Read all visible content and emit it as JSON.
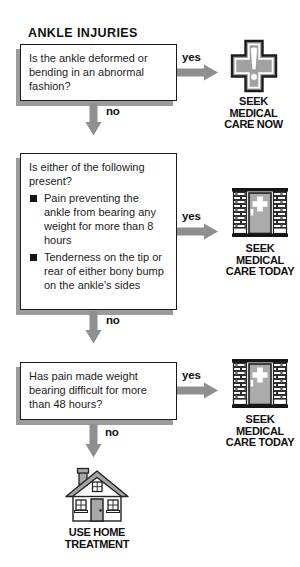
{
  "title": "ANKLE INJURIES",
  "labels": {
    "yes": "yes",
    "no": "no"
  },
  "steps": [
    {
      "question": "Is the ankle deformed or bending in an abnormal fashion?",
      "yes_outcome": {
        "icon": "medical-cross-icon",
        "lines": [
          "SEEK",
          "MEDICAL",
          "CARE NOW"
        ]
      }
    },
    {
      "question": "Is either of the following present?",
      "bullets": [
        "Pain preventing the ankle from bearing any weight for more than 8 hours",
        "Tenderness on the tip or rear of either bony bump on the ankle's sides"
      ],
      "yes_outcome": {
        "icon": "clinic-building-icon",
        "lines": [
          "SEEK",
          "MEDICAL",
          "CARE TODAY"
        ]
      }
    },
    {
      "question": "Has pain made weight bearing difficult for more than 48 hours?",
      "yes_outcome": {
        "icon": "clinic-building-icon",
        "lines": [
          "SEEK",
          "MEDICAL",
          "CARE TODAY"
        ]
      }
    }
  ],
  "final_outcome": {
    "icon": "house-icon",
    "lines": [
      "USE HOME",
      "TREATMENT"
    ]
  },
  "colors": {
    "arrow_gray": "#8d8f90",
    "shadow_gray": "#9b9b9b",
    "icon_gray": "#a2a2a2",
    "door_gray": "#ababab",
    "text_black": "#111111"
  }
}
